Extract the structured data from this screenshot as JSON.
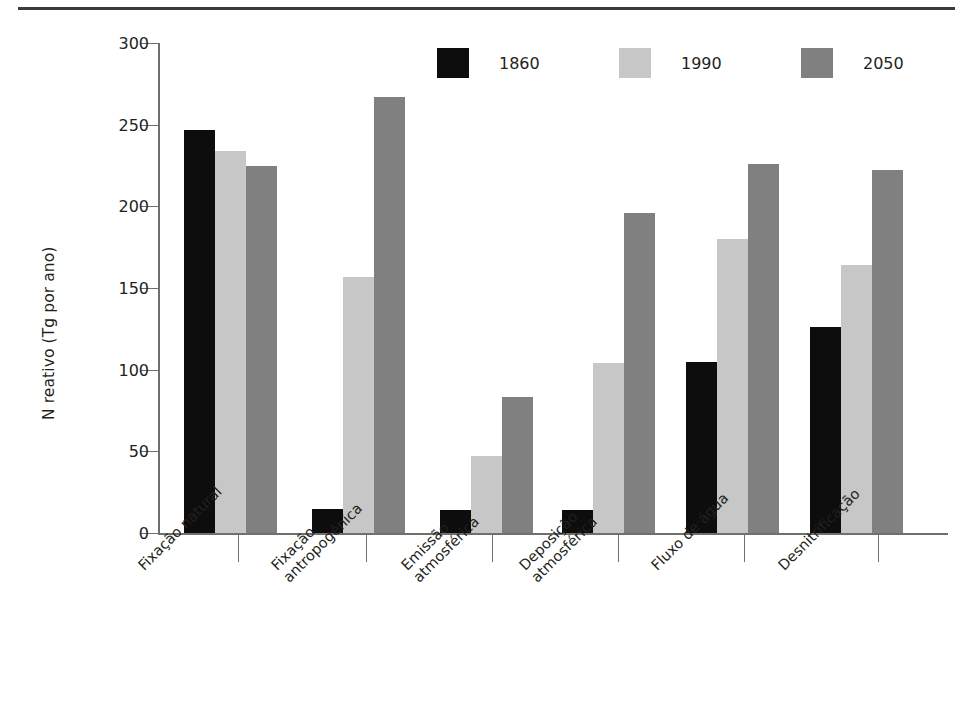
{
  "figure": {
    "y_axis_title": "N reativo (Tg por ano)"
  },
  "chart_data": {
    "type": "bar",
    "title": "",
    "xlabel": "",
    "ylabel": "N reativo (Tg por ano)",
    "ylim": [
      0,
      300
    ],
    "yticks": [
      0,
      50,
      100,
      150,
      200,
      250,
      300
    ],
    "ytick_labels": [
      "0",
      "50",
      "100",
      "150",
      "200",
      "250",
      "300"
    ],
    "grid": false,
    "legend_position": "top-center",
    "categories": [
      "Fixação natural",
      "Fixação antropogênica",
      "Emissão atmosférica",
      "Deposição atmosférica",
      "Fluxo de água",
      "Desnitrificação"
    ],
    "category_lines": [
      [
        "Fixação natural"
      ],
      [
        "Fixação",
        "antropogênica"
      ],
      [
        "Emissão",
        "atmosférica"
      ],
      [
        "Deposição",
        "atmosférica"
      ],
      [
        "Fluxo de água"
      ],
      [
        "Desnitrificação"
      ]
    ],
    "series": [
      {
        "name": "1860",
        "color": "#0d0d0d",
        "values": [
          247,
          15,
          14,
          14,
          105,
          126
        ]
      },
      {
        "name": "1990",
        "color": "#c7c7c7",
        "values": [
          234,
          157,
          47,
          104,
          180,
          164
        ]
      },
      {
        "name": "2050",
        "color": "#808080",
        "values": [
          225,
          267,
          83,
          196,
          226,
          222
        ]
      }
    ]
  },
  "legend": {
    "items": [
      {
        "label": "1860",
        "color": "#0d0d0d"
      },
      {
        "label": "1990",
        "color": "#c7c7c7"
      },
      {
        "label": "2050",
        "color": "#808080"
      }
    ]
  },
  "colors": {
    "axis": "#6f6f6f",
    "text": "#231f20",
    "rule": "#3b3b3b",
    "background": "#ffffff"
  }
}
